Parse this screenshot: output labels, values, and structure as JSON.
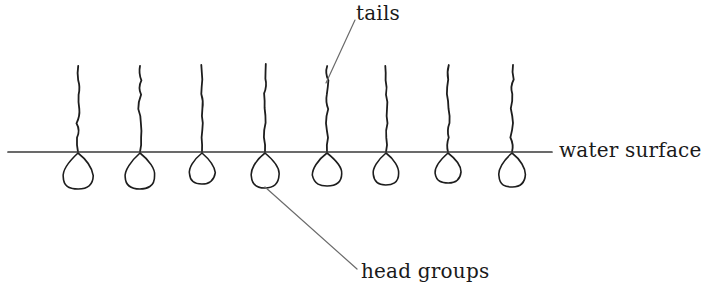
{
  "figure": {
    "background_color": "#ffffff",
    "ink_color": "#1d1d1d",
    "leader_color": "#555555",
    "width": 703,
    "height": 298
  },
  "labels": {
    "tails": "tails",
    "water_surface": "water surface",
    "head_groups": "head groups"
  },
  "chart_data": {
    "type": "diagram",
    "annotations": [
      {
        "label": "tails",
        "text_x": 356,
        "text_y": 3,
        "leader_from_x": 355,
        "leader_from_y": 20,
        "leader_to_x": 326,
        "leader_to_y": 83
      },
      {
        "label": "water surface",
        "text_x": 559,
        "text_y": 140,
        "leader_from_x": null,
        "leader_from_y": null,
        "leader_to_x": null,
        "leader_to_y": null
      },
      {
        "label": "head groups",
        "text_x": 361,
        "text_y": 261,
        "leader_from_x": 357,
        "leader_from_y": 269,
        "leader_to_x": 265,
        "leader_to_y": 187
      }
    ],
    "water_line": {
      "x_start": 8,
      "x_end": 552,
      "y": 152
    },
    "molecule_count": 8,
    "molecules": [
      {
        "index": 1,
        "stem_x": 78,
        "tail_top_y": 66,
        "head_width": 30,
        "head_height": 36
      },
      {
        "index": 2,
        "stem_x": 140,
        "tail_top_y": 66,
        "head_width": 30,
        "head_height": 36
      },
      {
        "index": 3,
        "stem_x": 202,
        "tail_top_y": 65,
        "head_width": 26,
        "head_height": 31
      },
      {
        "index": 4,
        "stem_x": 265,
        "tail_top_y": 64,
        "head_width": 29,
        "head_height": 35
      },
      {
        "index": 5,
        "stem_x": 327,
        "tail_top_y": 66,
        "head_width": 29,
        "head_height": 33
      },
      {
        "index": 6,
        "stem_x": 386,
        "tail_top_y": 66,
        "head_width": 27,
        "head_height": 32
      },
      {
        "index": 7,
        "stem_x": 448,
        "tail_top_y": 65,
        "head_width": 26,
        "head_height": 30
      },
      {
        "index": 8,
        "stem_x": 512,
        "tail_top_y": 65,
        "head_width": 28,
        "head_height": 34
      }
    ]
  }
}
